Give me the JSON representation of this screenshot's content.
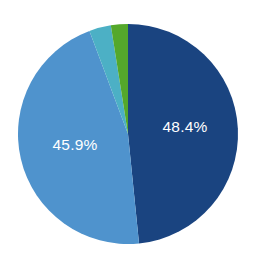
{
  "chart_data": {
    "type": "pie",
    "title": "",
    "subtitle": "",
    "xlabel": "",
    "ylabel": "",
    "grid": false,
    "legend": "none",
    "start_angle_deg": 0,
    "direction": "clockwise",
    "center": {
      "cx": 128,
      "cy": 134
    },
    "radius": 110,
    "background_color": "#ffffff",
    "label_color": "#ffffff",
    "categories": [
      "Series 1",
      "Series 2",
      "Series 3",
      "Series 4"
    ],
    "values": [
      48.4,
      45.9,
      3.2,
      2.5
    ],
    "labels_shown": [
      "48.4%",
      "45.9%",
      "",
      ""
    ],
    "colors": [
      "#1a4480",
      "#4f93cd",
      "#4cb0c5",
      "#54a82b"
    ],
    "slices": [
      {
        "name": "slice-dark-blue",
        "value": 48.4,
        "label": "48.4%",
        "label_visible": true,
        "color": "#1a4480",
        "label_x": 185,
        "label_y": 128
      },
      {
        "name": "slice-light-blue",
        "value": 45.9,
        "label": "45.9%",
        "label_visible": true,
        "color": "#4f93cd",
        "label_x": 75,
        "label_y": 146
      },
      {
        "name": "slice-teal",
        "value": 3.2,
        "label": "",
        "label_visible": false,
        "color": "#4cb0c5",
        "label_x": 0,
        "label_y": 0
      },
      {
        "name": "slice-green",
        "value": 2.5,
        "label": "",
        "label_visible": false,
        "color": "#54a82b",
        "label_x": 0,
        "label_y": 0
      }
    ]
  }
}
